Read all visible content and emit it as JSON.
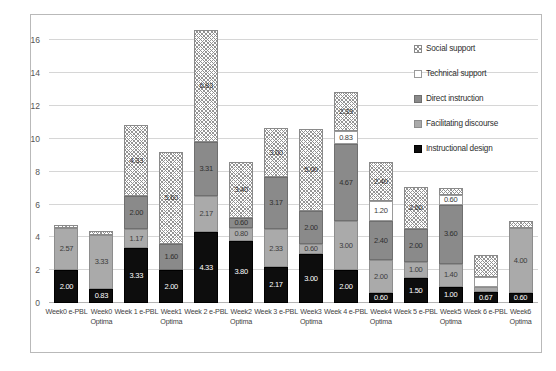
{
  "chart_data": {
    "type": "bar",
    "stacked": true,
    "title": "",
    "xlabel": "",
    "ylabel": "",
    "ylim": [
      0,
      17
    ],
    "yticks": [
      0,
      2,
      4,
      6,
      8,
      10,
      12,
      14,
      16
    ],
    "grid": true,
    "legend_position": "right",
    "categories": [
      "Week0 e-PBL",
      "Week0 Optima",
      "Week 1 e-PBL",
      "Week1 Optima",
      "Week 2 e-PBL",
      "Week2 Optima",
      "Week 3 e-PBL",
      "Week3 Optima",
      "Week 4 e-PBL",
      "Week4 Optima",
      "Week 5 e-PBL",
      "Week5 Optima",
      "Week 6 e-PBL",
      "Week6 Optima"
    ],
    "category_lines": [
      [
        "Week0 e-PBL",
        ""
      ],
      [
        "Week0",
        "Optima"
      ],
      [
        "Week 1 e-PBL",
        ""
      ],
      [
        "Week1",
        "Optima"
      ],
      [
        "Week 2 e-PBL",
        ""
      ],
      [
        "Week2",
        "Optima"
      ],
      [
        "Week 3 e-PBL",
        ""
      ],
      [
        "Week3",
        "Optima"
      ],
      [
        "Week 4 e-PBL",
        ""
      ],
      [
        "Week4",
        "Optima"
      ],
      [
        "Week 5 e-PBL",
        ""
      ],
      [
        "Week5",
        "Optima"
      ],
      [
        "Week 6 e-PBL",
        ""
      ],
      [
        "Week6",
        "Optima"
      ]
    ],
    "series": [
      {
        "name": "Instructional design",
        "key": "instr",
        "color": "#0d0d0d",
        "values": [
          2.0,
          0.83,
          3.33,
          2.0,
          4.33,
          3.8,
          2.17,
          3.0,
          2.0,
          0.6,
          1.5,
          1.0,
          0.67,
          0.6
        ],
        "labels": [
          "2.00",
          "0.83",
          "3.33",
          "2.00",
          "4.33",
          "3.80",
          "2.17",
          "3.00",
          "2.00",
          "0.60",
          "1.50",
          "1.00",
          "0.67",
          "0.60"
        ]
      },
      {
        "name": "Facilitating discourse",
        "key": "fac",
        "color": "#aaaaaa",
        "values": [
          2.57,
          3.33,
          1.17,
          0.0,
          2.17,
          0.8,
          2.33,
          0.6,
          3.0,
          2.0,
          1.0,
          1.4,
          0.33,
          4.0
        ],
        "labels": [
          "2.57",
          "3.33",
          "1.17",
          "0.00",
          "2.17",
          "0.80",
          "2.33",
          "0.60",
          "3.00",
          "2.00",
          "1.00",
          "1.40",
          "",
          "4.00"
        ]
      },
      {
        "name": "Direct instruction",
        "key": "direct",
        "color": "#8a8a8a",
        "values": [
          0.0,
          0.0,
          2.0,
          1.6,
          3.31,
          0.6,
          3.17,
          2.0,
          4.67,
          2.4,
          2.0,
          3.6,
          0.0,
          0.0
        ],
        "labels": [
          "",
          "",
          "2.00",
          "1.60",
          "3.31",
          "0.60",
          "3.17",
          "2.00",
          "4.67",
          "2.40",
          "2.00",
          "3.60",
          "",
          ""
        ]
      },
      {
        "name": "Technical support",
        "key": "tech",
        "color": "#ffffff",
        "values": [
          0.0,
          0.0,
          0.0,
          0.0,
          0.0,
          0.0,
          0.0,
          0.0,
          0.83,
          1.2,
          0.0,
          0.6,
          0.6,
          0.0
        ],
        "labels": [
          "",
          "",
          "",
          "",
          "",
          "",
          "",
          "",
          "0.83",
          "1.20",
          "",
          "0.60",
          "",
          ""
        ]
      },
      {
        "name": "Social support",
        "key": "social",
        "color": "#8f8f8f",
        "values": [
          0.2,
          0.2,
          4.33,
          5.6,
          6.83,
          3.4,
          3.0,
          5.0,
          2.33,
          2.4,
          2.6,
          0.4,
          1.33,
          0.4
        ],
        "labels": [
          "",
          "",
          "4.33",
          "5.60",
          "6.83",
          "3.40",
          "3.00",
          "5.00",
          "2.33",
          "2.40",
          "2.60",
          "",
          "",
          ""
        ]
      }
    ],
    "totals": [
      4.77,
      4.36,
      10.83,
      9.2,
      16.64,
      8.6,
      10.67,
      10.6,
      12.83,
      8.6,
      7.1,
      7.0,
      2.93,
      5.0
    ],
    "legend": [
      {
        "label": "Social support",
        "key": "social",
        "pattern": "crosshatch"
      },
      {
        "label": "Technical support",
        "key": "tech",
        "pattern": "empty"
      },
      {
        "label": "Direct instruction",
        "key": "direct",
        "pattern": "dark-gray"
      },
      {
        "label": "Facilitating discourse",
        "key": "fac",
        "pattern": "light-gray"
      },
      {
        "label": "Instructional design",
        "key": "instr",
        "pattern": "black"
      }
    ]
  }
}
